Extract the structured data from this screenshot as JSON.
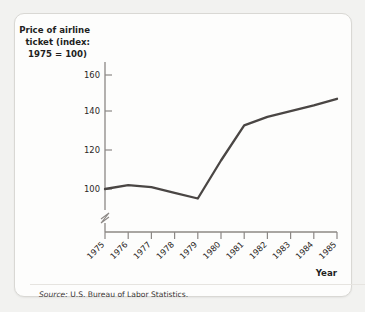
{
  "card": {
    "source_prefix": "Source:",
    "source_text": " U.S. Bureau of Labor Statistics."
  },
  "chart_data": {
    "type": "line",
    "title": "Price of airline ticket (index: 1975 = 100)",
    "title_lines": [
      "Price of airline",
      "ticket (index:",
      "1975 = 100)"
    ],
    "xlabel": "Year",
    "ylabel": "",
    "x": [
      1975,
      1976,
      1977,
      1978,
      1979,
      1980,
      1981,
      1982,
      1983,
      1984,
      1985
    ],
    "categories": [
      "1975",
      "1976",
      "1977",
      "1978",
      "1979",
      "1980",
      "1981",
      "1982",
      "1983",
      "1984",
      "1985"
    ],
    "values": [
      100,
      102,
      101,
      98,
      95,
      115,
      133.5,
      138,
      141,
      144,
      147.5
    ],
    "series": [
      {
        "name": "Price of airline ticket (index: 1975 = 100)",
        "values": [
          100,
          102,
          101,
          98,
          95,
          115,
          133.5,
          138,
          141,
          144,
          147.5
        ]
      }
    ],
    "yticks": [
      100,
      120,
      140,
      160
    ],
    "ytick_labels": [
      "100",
      "120",
      "140",
      "160"
    ],
    "ylim": [
      88,
      168
    ],
    "xlim": [
      1975,
      1985
    ],
    "axis_break": true,
    "grid": false,
    "legend": "none",
    "line_color": "#4a4644",
    "axis_color": "#8c8885",
    "source": "Source: U.S. Bureau of Labor Statistics."
  }
}
